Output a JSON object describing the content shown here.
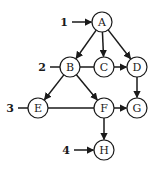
{
  "diagram": {
    "type": "directed-graph",
    "nodes": [
      {
        "id": "A",
        "label": "A",
        "x": 102,
        "y": 22
      },
      {
        "id": "B",
        "label": "B",
        "x": 70,
        "y": 67
      },
      {
        "id": "C",
        "label": "C",
        "x": 104,
        "y": 67
      },
      {
        "id": "D",
        "label": "D",
        "x": 137,
        "y": 67
      },
      {
        "id": "E",
        "label": "E",
        "x": 38,
        "y": 108
      },
      {
        "id": "F",
        "label": "F",
        "x": 104,
        "y": 108
      },
      {
        "id": "G",
        "label": "G",
        "x": 137,
        "y": 108
      },
      {
        "id": "H",
        "label": "H",
        "x": 104,
        "y": 150
      }
    ],
    "edges": [
      {
        "from": "A",
        "to": "B",
        "arrow": true
      },
      {
        "from": "A",
        "to": "C",
        "arrow": true
      },
      {
        "from": "A",
        "to": "D",
        "arrow": true
      },
      {
        "from": "B",
        "to": "C",
        "arrow": false
      },
      {
        "from": "C",
        "to": "D",
        "arrow": true
      },
      {
        "from": "B",
        "to": "E",
        "arrow": true
      },
      {
        "from": "B",
        "to": "F",
        "arrow": true
      },
      {
        "from": "E",
        "to": "F",
        "arrow": false
      },
      {
        "from": "F",
        "to": "G",
        "arrow": true
      },
      {
        "from": "D",
        "to": "G",
        "arrow": true
      },
      {
        "from": "F",
        "to": "H",
        "arrow": true
      }
    ],
    "level_markers": [
      {
        "label": "1",
        "target": "A",
        "arrow": true
      },
      {
        "label": "2",
        "target": "B",
        "arrow": false
      },
      {
        "label": "3",
        "target": "E",
        "arrow": false
      },
      {
        "label": "4",
        "target": "H",
        "arrow": true
      }
    ],
    "node_radius": 10,
    "colors": {
      "stroke": "#1a1a1a",
      "fill": "#ffffff"
    }
  }
}
